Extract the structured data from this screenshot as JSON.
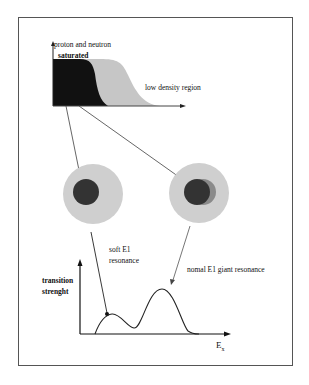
{
  "figure": {
    "top_panel": {
      "label_top_line1": "proton and neutron",
      "label_top_line2": "saturated",
      "label_right": "low density region"
    },
    "nuclei": [
      {
        "name": "soft-e1-nucleus",
        "description": "core-halo nucleus"
      },
      {
        "name": "normal-e1-nucleus",
        "description": "nucleus with proton/neutron cores offset"
      }
    ],
    "bottom_panel": {
      "ylabel_line1": "transition",
      "ylabel_line2": "strenght",
      "xlabel": "E",
      "xlabel_sub": "x",
      "annotation_soft_line1": "soft E1",
      "annotation_soft_line2": "resonance",
      "annotation_normal": "nomal E1 giant resonance"
    },
    "colors": {
      "dense_core": "#111111",
      "halo": "#c8c8c8",
      "nucleus_outer": "#cfcfcf",
      "nucleus_inner": "#333333",
      "offset_core": "#8a8a8a",
      "line": "#333333"
    }
  }
}
